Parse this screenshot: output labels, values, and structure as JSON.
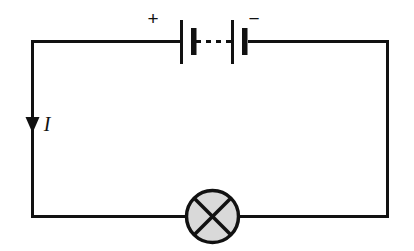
{
  "figure": {
    "name": "simple-series-circuit",
    "background_color": "#ffffff",
    "line_color": "#111111",
    "lamp_fill_color": "#d9d9d9",
    "width": 414,
    "height": 251
  },
  "labels": {
    "positive_terminal": "+",
    "negative_terminal": "−",
    "current": "I"
  },
  "components": {
    "battery": {
      "name": "battery-two-cells",
      "cell_count": 2,
      "link_style": "dashed"
    },
    "lamp": {
      "name": "lamp-crossed-circle",
      "fill": "#d9d9d9"
    },
    "current_arrow": {
      "name": "current-direction-arrow",
      "direction": "down"
    }
  }
}
